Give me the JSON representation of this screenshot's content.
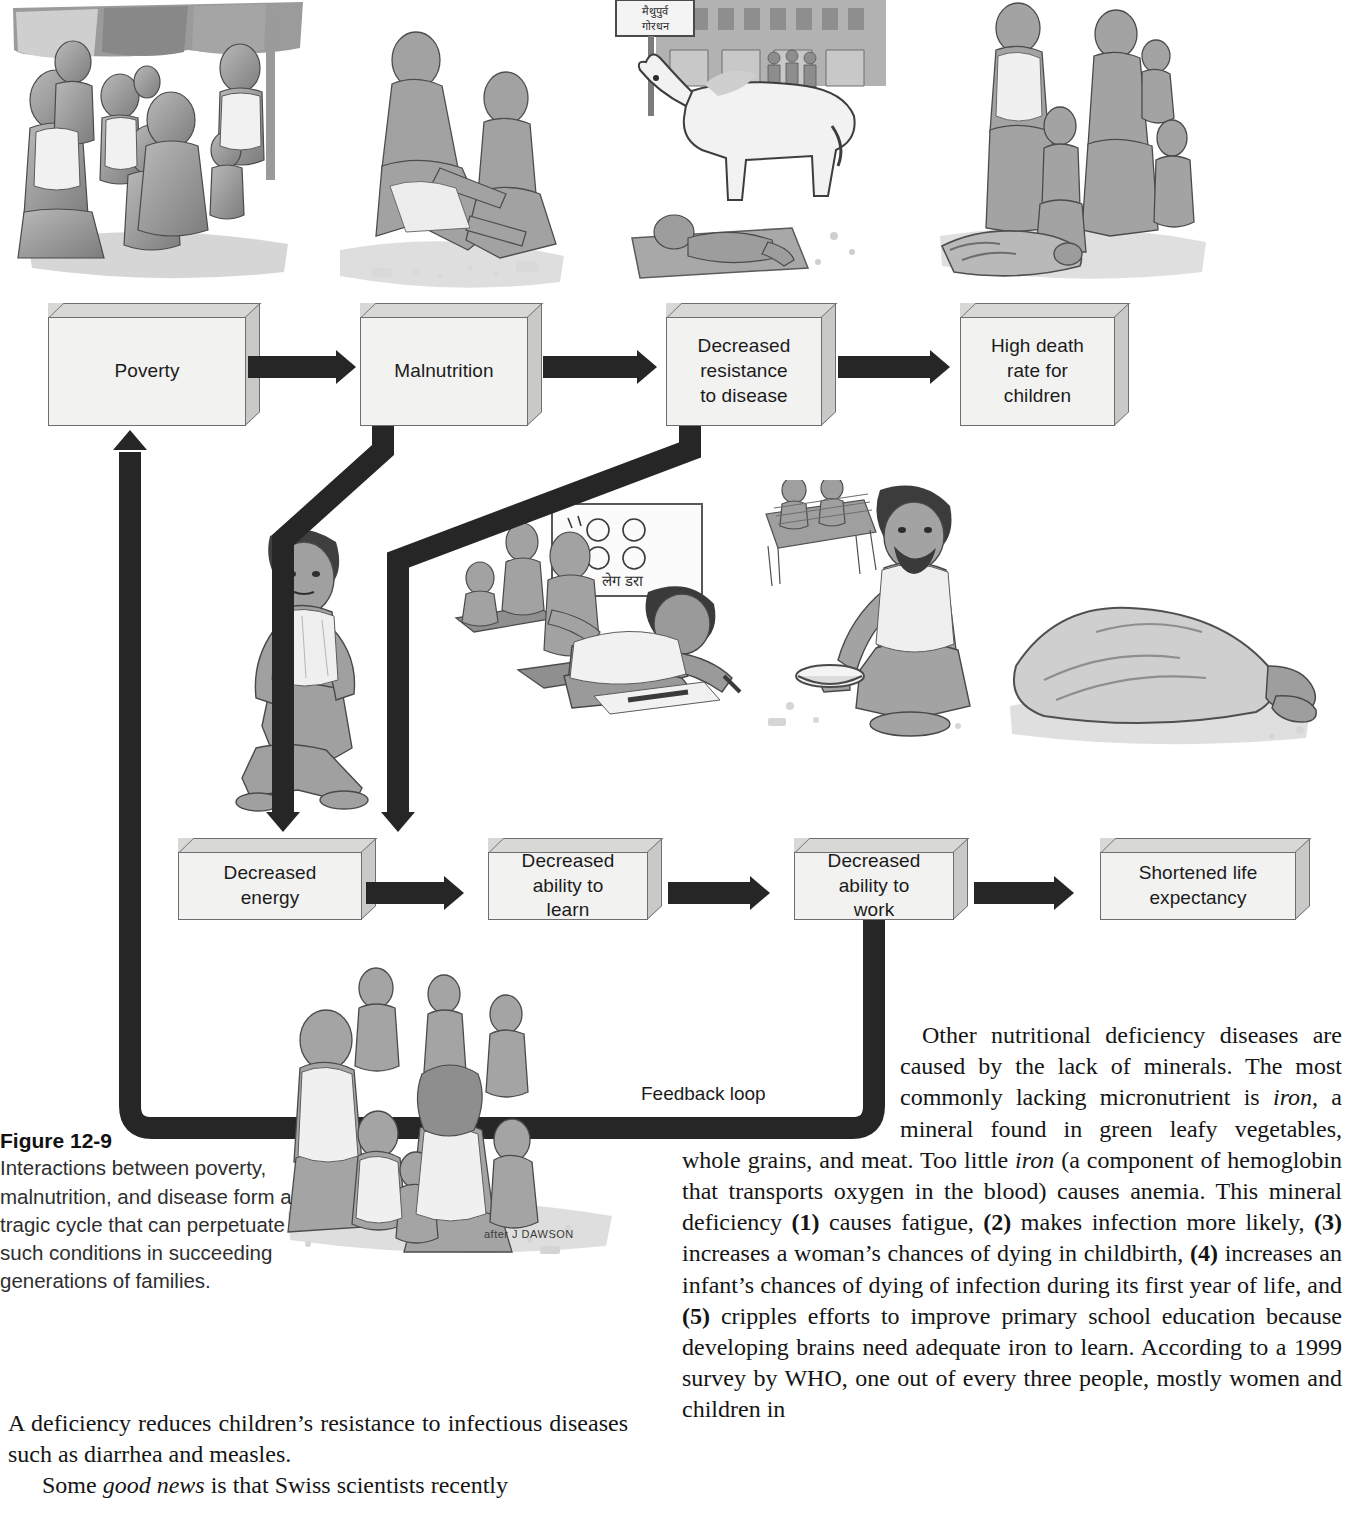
{
  "figure": {
    "caption_number": "Figure 12-9",
    "caption_text": "Interactions between poverty, malnutrition, and disease form a tragic cycle that can perpetuate such conditions in succeeding generations of families.",
    "artist_credit": "after J DAWSON",
    "feedback_label": "Feedback loop",
    "sign_text": "मैथुपुर्व गोरधन",
    "blackboard_text": "लेग डरा",
    "nodes": [
      {
        "id": "poverty",
        "label": "Poverty"
      },
      {
        "id": "malnutrition",
        "label": "Malnutrition"
      },
      {
        "id": "decreased-resistance",
        "label": "Decreased\nresistance\nto disease"
      },
      {
        "id": "high-death-rate",
        "label": "High death\nrate for\nchildren"
      },
      {
        "id": "decreased-energy",
        "label": "Decreased\nenergy"
      },
      {
        "id": "decreased-ability-learn",
        "label": "Decreased\nability to\nlearn"
      },
      {
        "id": "decreased-ability-work",
        "label": "Decreased\nability to\nwork"
      },
      {
        "id": "shortened-life",
        "label": "Shortened life\nexpectancy"
      }
    ]
  },
  "body": {
    "left_column": {
      "para1": "A deficiency reduces children’s resistance to infectious diseases such as diarrhea and measles.",
      "para2_pre": "Some ",
      "para2_italic": "good news",
      "para2_post": " is that Swiss scientists recently"
    },
    "right_column": {
      "para1_a": "Other nutritional deficiency diseases are caused by the lack of minerals. The most commonly lacking micronutrient is ",
      "para1_iron1": "iron",
      "para1_b": ", a mineral found in green leafy vegetables, whole grains, and meat. Too little ",
      "para1_iron2": "iron",
      "para1_c": " (a component of hemoglobin that transports oxygen in the blood) causes anemia. This mineral deficiency ",
      "n1": "(1)",
      "t1": " causes fatigue, ",
      "n2": "(2)",
      "t2": " makes infection more likely, ",
      "n3": "(3)",
      "t3": " increases a woman’s chances of dying in childbirth, ",
      "n4": "(4)",
      "t4": " increases an infant’s chances of dying of infection during its first year of life, and ",
      "n5": "(5)",
      "t5": " cripples efforts to improve primary school education because developing brains need adequate iron to learn. According to a 1999 survey by WHO, one out of every three people, mostly women and children in"
    }
  },
  "colors": {
    "arrow": "#262626",
    "box_face": "#f2f2f1",
    "box_top": "#d8d8d6",
    "box_side": "#c9c9c7",
    "box_border": "#6e6e6e",
    "text": "#1a1a1a",
    "page_background": "#ffffff"
  }
}
